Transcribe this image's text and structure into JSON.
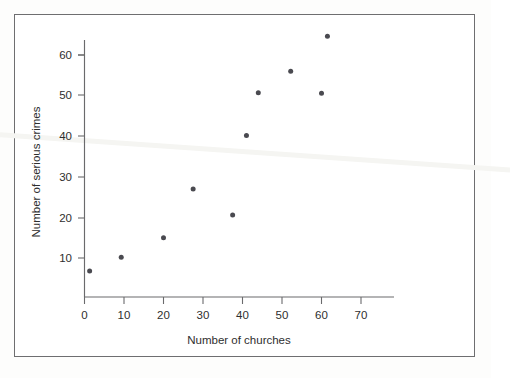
{
  "chart_data": {
    "type": "scatter",
    "title": "",
    "xlabel": "Number of churches",
    "ylabel": "Number of serious crimes",
    "xlim": [
      0,
      76
    ],
    "ylim": [
      0,
      68
    ],
    "xticks": [
      "0",
      "10",
      "20",
      "30",
      "40",
      "50",
      "60",
      "70"
    ],
    "xtick_values": [
      0,
      10,
      20,
      30,
      40,
      50,
      60,
      70
    ],
    "yticks": [
      "10",
      "20",
      "30",
      "40",
      "50",
      "60"
    ],
    "ytick_values": [
      10,
      20,
      30,
      40,
      50,
      60
    ],
    "grid": false,
    "legend": null,
    "marker": "filled-circle",
    "marker_color": "#4a4a50",
    "points": [
      {
        "x": 1.3,
        "y": 6.8
      },
      {
        "x": 9.3,
        "y": 10.2
      },
      {
        "x": 20.0,
        "y": 15.0
      },
      {
        "x": 27.5,
        "y": 27.0
      },
      {
        "x": 37.5,
        "y": 20.6
      },
      {
        "x": 41.0,
        "y": 40.2
      },
      {
        "x": 44.0,
        "y": 50.7
      },
      {
        "x": 52.2,
        "y": 56.0
      },
      {
        "x": 60.0,
        "y": 50.6
      },
      {
        "x": 61.5,
        "y": 64.6
      }
    ]
  },
  "figure": {
    "frame_color": "#6e6e70",
    "axis_color": "#6a6a6c",
    "text_color": "#2e2e2e",
    "background": "#ffffff",
    "crease_color": "#ededea"
  }
}
